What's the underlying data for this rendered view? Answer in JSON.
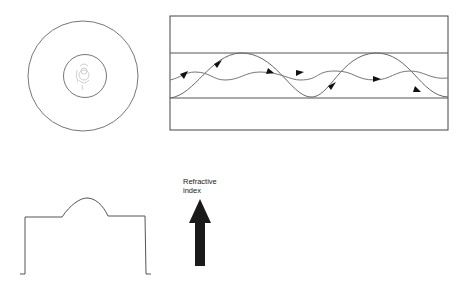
{
  "diagram": {
    "cross_section": {
      "description": "Fiber end view: cladding ring with small core"
    },
    "side_view": {
      "description": "Light rays following sinusoidal paths within the core"
    },
    "index_profile": {
      "description": "Refractive index profile: flat cladding with parabolic core bump"
    },
    "axis_label": {
      "line1": "Refractive",
      "line2": "index"
    }
  }
}
